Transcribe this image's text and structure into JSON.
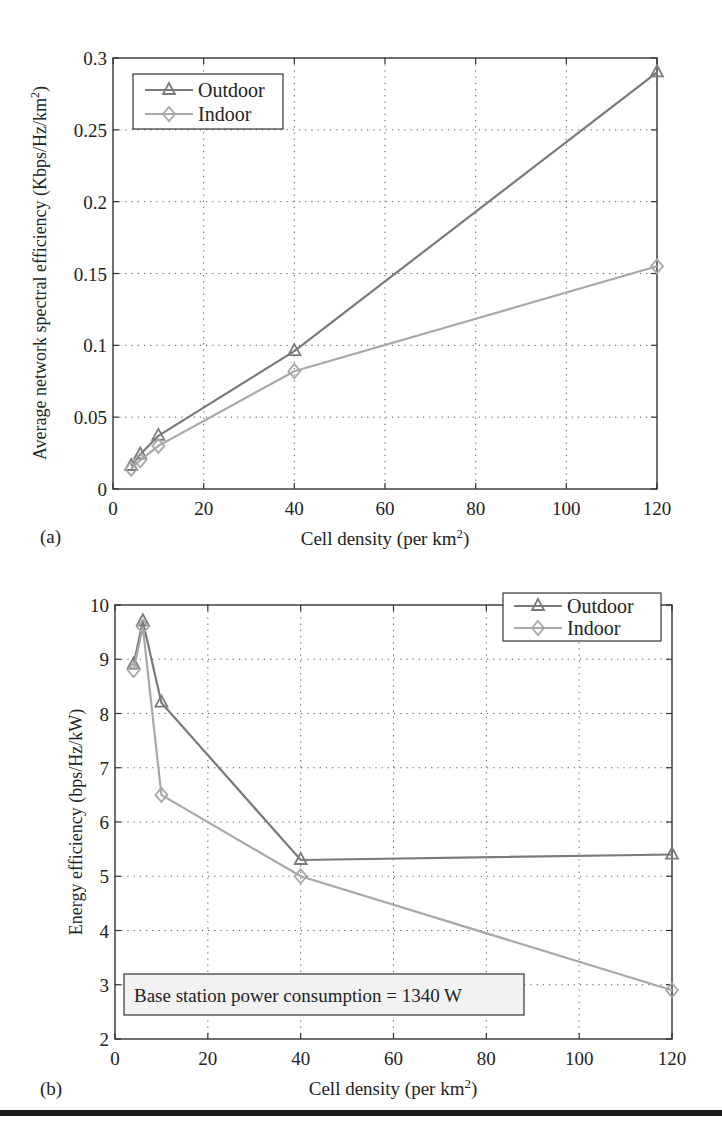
{
  "chart_data": [
    {
      "panel_label": "(a)",
      "type": "line",
      "title": "",
      "xlabel": "Cell density (per km²)",
      "ylabel": "Average network spectral efficiency (Kbps/Hz/km²)",
      "xlim": [
        0,
        120
      ],
      "ylim": [
        0,
        0.3
      ],
      "xticks": [
        "0",
        "20",
        "40",
        "60",
        "80",
        "100",
        "120"
      ],
      "yticks": [
        "0",
        "0.05",
        "0.1",
        "0.15",
        "0.2",
        "0.25",
        "0.3"
      ],
      "grid": true,
      "legend_position": "upper left",
      "series": [
        {
          "name": "Outdoor",
          "marker": "triangle",
          "color": "#7a7a7a",
          "x": [
            4,
            6,
            10,
            40,
            120
          ],
          "y": [
            0.016,
            0.024,
            0.037,
            0.096,
            0.29
          ]
        },
        {
          "name": "Indoor",
          "marker": "diamond",
          "color": "#a8a8a8",
          "x": [
            4,
            6,
            10,
            40,
            120
          ],
          "y": [
            0.014,
            0.02,
            0.03,
            0.082,
            0.155
          ]
        }
      ]
    },
    {
      "panel_label": "(b)",
      "type": "line",
      "title": "",
      "xlabel": "Cell density (per km²)",
      "ylabel": "Energy efficiency (bps/Hz/kW)",
      "xlim": [
        0,
        120
      ],
      "ylim": [
        2,
        10
      ],
      "xticks": [
        "0",
        "20",
        "40",
        "60",
        "80",
        "100",
        "120"
      ],
      "yticks": [
        "2",
        "3",
        "4",
        "5",
        "6",
        "7",
        "8",
        "9",
        "10"
      ],
      "grid": true,
      "legend_position": "upper right",
      "annotation": "Base station power consumption = 1340 W",
      "series": [
        {
          "name": "Outdoor",
          "marker": "triangle",
          "color": "#7a7a7a",
          "x": [
            4,
            6,
            10,
            40,
            120
          ],
          "y": [
            8.9,
            9.7,
            8.2,
            5.3,
            5.4
          ]
        },
        {
          "name": "Indoor",
          "marker": "diamond",
          "color": "#a8a8a8",
          "x": [
            4,
            6,
            10,
            40,
            120
          ],
          "y": [
            8.8,
            9.6,
            6.5,
            5.0,
            2.9
          ]
        }
      ]
    }
  ],
  "panels": {
    "a": {
      "label": "(a)",
      "xlabel_main": "Cell density (per km",
      "xlabel_sup": "2",
      "xlabel_end": ")",
      "ylabel_main": "Average network spectral efficiency (Kbps/Hz/km",
      "ylabel_sup": "2",
      "ylabel_end": ")",
      "legend": [
        "Outdoor",
        "Indoor"
      ]
    },
    "b": {
      "label": "(b)",
      "xlabel_main": "Cell density (per km",
      "xlabel_sup": "2",
      "xlabel_end": ")",
      "ylabel": "Energy efficiency (bps/Hz/kW)",
      "legend": [
        "Outdoor",
        "Indoor"
      ],
      "annotation": "Base station power consumption = 1340 W"
    }
  }
}
